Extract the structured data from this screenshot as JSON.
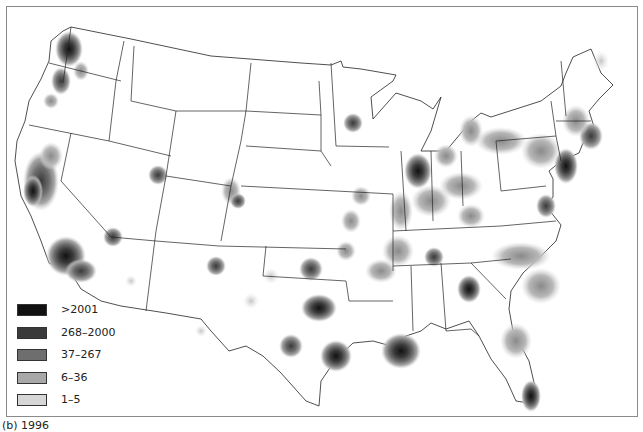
{
  "map": {
    "type": "choropleth-density",
    "region": "Contiguous United States",
    "caption": "(b) 1996",
    "legend": {
      "title": "",
      "items": [
        {
          "label": ">2001",
          "color": "#111111"
        },
        {
          "label": "268–2000",
          "color": "#3a3a3a"
        },
        {
          "label": "37–267",
          "color": "#6e6e6e"
        },
        {
          "label": "6–36",
          "color": "#a8a8a8"
        },
        {
          "label": "1–5",
          "color": "#d6d6d6"
        }
      ]
    },
    "hotspots": [
      {
        "area": "Seattle, WA",
        "level": ">2001"
      },
      {
        "area": "Portland, OR",
        "level": "37–267"
      },
      {
        "area": "San Francisco Bay, CA",
        "level": "268–2000"
      },
      {
        "area": "Los Angeles, CA",
        "level": ">2001"
      },
      {
        "area": "Salt Lake City, UT",
        "level": "37–267"
      },
      {
        "area": "Las Vegas, NV",
        "level": "37–267"
      },
      {
        "area": "Denver, CO",
        "level": "37–267"
      },
      {
        "area": "Minneapolis, MN",
        "level": "37–267"
      },
      {
        "area": "Chicago, IL",
        "level": ">2001"
      },
      {
        "area": "Dallas, TX",
        "level": "268–2000"
      },
      {
        "area": "Houston, TX",
        "level": "268–2000"
      },
      {
        "area": "New Orleans, LA",
        "level": "268–2000"
      },
      {
        "area": "Atlanta, GA",
        "level": "268–2000"
      },
      {
        "area": "Miami, FL",
        "level": "268–2000"
      },
      {
        "area": "Washington, DC / Baltimore",
        "level": "268–2000"
      },
      {
        "area": "New York, NY",
        "level": ">2001"
      },
      {
        "area": "Boston, MA",
        "level": "268–2000"
      }
    ]
  }
}
